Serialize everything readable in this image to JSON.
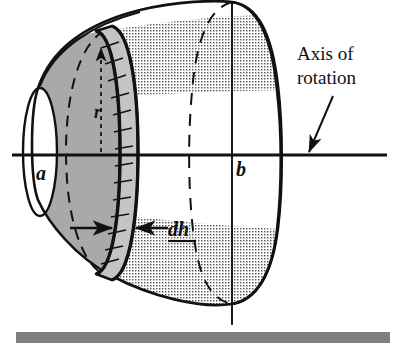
{
  "figure": {
    "title_text": "",
    "labels": {
      "axis_line1": "Axis of",
      "axis_line2": "rotation",
      "inner_radius": "a",
      "outer_radius": "b",
      "shell_radius": "r",
      "thickness": "dh"
    },
    "colors": {
      "outline": "#111111",
      "disk_fill": "#a9a9a9",
      "band_fill": "#c4c4c4",
      "dot_texture": "#575757",
      "dot_background": "#ffffff",
      "footer_bar": "#7f7f7f",
      "page_background": "#ffffff"
    },
    "annotations": {
      "band_segment_count": 19,
      "arrow_target": "axis-of-rotation-line",
      "dh_underline": true
    },
    "axis": {
      "orientation": "horizontal",
      "x_start": 12,
      "x_end": 387,
      "y": 155
    },
    "footer_bar": {
      "x": 16,
      "y": 332,
      "width": 374,
      "height": 11
    }
  }
}
